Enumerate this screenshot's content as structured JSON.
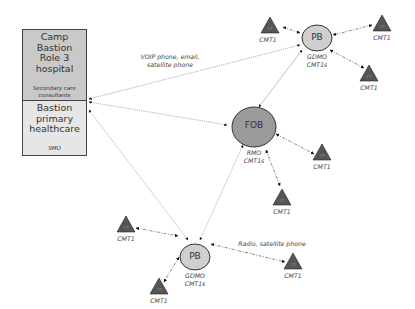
{
  "hospital": {
    "title_lines": [
      "Camp",
      "Bastion",
      "Role 3",
      "hospital"
    ],
    "subtitle_lines": [
      "Secondary care",
      "consultants"
    ]
  },
  "primary": {
    "title_lines": [
      "Bastion",
      "primary",
      "healthcare"
    ],
    "subtitle": "SMO"
  },
  "fob": {
    "label": "FOB",
    "caption_lines": [
      "RMO",
      "CMT1s"
    ]
  },
  "pb_top": {
    "label": "PB",
    "caption_lines": [
      "GDMO",
      "CMT1s"
    ]
  },
  "pb_bottom": {
    "label": "PB",
    "caption_lines": [
      "GDMO",
      "CMT1s"
    ]
  },
  "links": {
    "voip_lines": [
      "VOIP phone, email,",
      "satellite phone"
    ],
    "radio": "Radio, satellite phone"
  },
  "cp": {
    "glyph": "CP",
    "caption": "CMT1"
  },
  "colors": {
    "hospital_fill": "#c9c9c9",
    "primary_fill": "#e6e6e6",
    "fob_fill": "#9a9a9a",
    "pb_fill": "#cfcfcf",
    "triangle_fill": "#555555",
    "outline": "#333333"
  }
}
